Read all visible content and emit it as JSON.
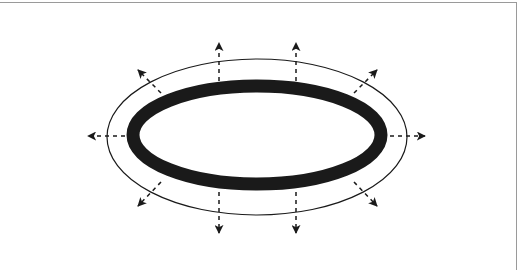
{
  "diagram": {
    "type": "outward-expansion-ellipse",
    "colors": {
      "background": "#ffffff",
      "frame": "#9a9a9a",
      "stroke": "#1a1a1a"
    },
    "inner_ellipse": {
      "cx": 257,
      "cy": 135,
      "rx": 124,
      "ry": 49,
      "stroke_width": 13,
      "color": "#1a1a1a"
    },
    "outer_ellipse": {
      "cx": 257,
      "cy": 137,
      "rx": 150,
      "ry": 78,
      "stroke_width": 1.2,
      "color": "#1a1a1a"
    },
    "arrows": [
      {
        "name": "arrow-left",
        "x1": 125,
        "y1": 136,
        "x2": 88,
        "y2": 136
      },
      {
        "name": "arrow-right",
        "x1": 390,
        "y1": 136,
        "x2": 425,
        "y2": 136
      },
      {
        "name": "arrow-up-left",
        "x1": 219,
        "y1": 81,
        "x2": 219,
        "y2": 43
      },
      {
        "name": "arrow-up-right",
        "x1": 296,
        "y1": 81,
        "x2": 296,
        "y2": 43
      },
      {
        "name": "arrow-down-left",
        "x1": 219,
        "y1": 192,
        "x2": 219,
        "y2": 233
      },
      {
        "name": "arrow-down-right",
        "x1": 296,
        "y1": 192,
        "x2": 296,
        "y2": 233
      },
      {
        "name": "arrow-diag-top-left",
        "x1": 161,
        "y1": 93,
        "x2": 138,
        "y2": 70
      },
      {
        "name": "arrow-diag-top-right",
        "x1": 354,
        "y1": 93,
        "x2": 377,
        "y2": 70
      },
      {
        "name": "arrow-diag-bottom-left",
        "x1": 161,
        "y1": 182,
        "x2": 138,
        "y2": 206
      },
      {
        "name": "arrow-diag-bottom-right",
        "x1": 354,
        "y1": 182,
        "x2": 377,
        "y2": 206
      }
    ]
  }
}
